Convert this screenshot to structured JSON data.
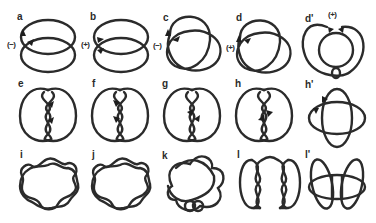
{
  "figure": {
    "type": "knot-and-link diagrams",
    "panels": [
      {
        "id": "a",
        "label": "a",
        "row": 1,
        "sign": "(−)",
        "description": "two-component link of overlapping ellipses with arrows"
      },
      {
        "id": "b",
        "label": "b",
        "row": 1,
        "sign": "(+)",
        "description": "two-component link of overlapping ellipses with arrows"
      },
      {
        "id": "c",
        "label": "c",
        "row": 1,
        "sign": "(−)",
        "description": "trefoil-like knot with arrow"
      },
      {
        "id": "d",
        "label": "d",
        "row": 1,
        "sign": "(+)",
        "description": "trefoil-like knot with arrow"
      },
      {
        "id": "d2",
        "label": "d'",
        "row": 1,
        "sign": "(+)",
        "description": "ring with inner loop and small twist at bottom"
      },
      {
        "id": "e",
        "label": "e",
        "row": 2,
        "description": "twisted two-loop figure with arrows"
      },
      {
        "id": "f",
        "label": "f",
        "row": 2,
        "description": "twisted two-loop figure with arrows"
      },
      {
        "id": "g",
        "label": "g",
        "row": 2,
        "description": "twisted two-loop figure with arrows"
      },
      {
        "id": "h",
        "label": "h",
        "row": 2,
        "description": "twisted two-loop figure with arrows"
      },
      {
        "id": "h2",
        "label": "h'",
        "row": 2,
        "description": "two crossing ellipses with arrows"
      },
      {
        "id": "i",
        "label": "i",
        "row": 3,
        "description": "eight-lobed braided ring"
      },
      {
        "id": "j",
        "label": "j",
        "row": 3,
        "description": "eight-lobed braided ring"
      },
      {
        "id": "k",
        "label": "k",
        "row": 3,
        "description": "five-lobed star knot with small loop at bottom"
      },
      {
        "id": "l",
        "label": "l",
        "row": 3,
        "description": "double twisted chain figure"
      },
      {
        "id": "l2",
        "label": "l'",
        "row": 3,
        "description": "butterfly-shaped four-lobed link"
      }
    ],
    "signs": {
      "a": "(−)",
      "b": "(+)",
      "c": "(−)",
      "d": "(+)",
      "d2": "(+)"
    }
  }
}
